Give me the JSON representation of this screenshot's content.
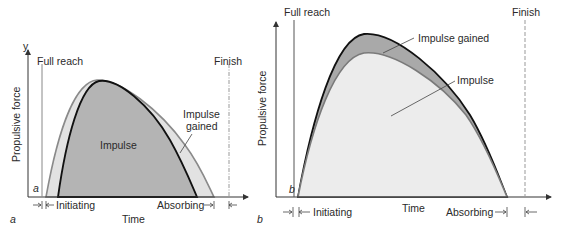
{
  "panels": [
    {
      "id": "a",
      "panel_label": "a",
      "corner_label": "a",
      "y_axis_letter": "y",
      "y_axis_label": "Propulsive force",
      "x_axis_label": "Time",
      "marker_left": "Full reach",
      "marker_right": "Finish",
      "area_inner_label": "Impulse",
      "area_outer_label_line1": "Impulse",
      "area_outer_label_line2": "gained",
      "phase_left": "Initiating",
      "phase_right": "Absorbing",
      "colors": {
        "inner_fill": "#b4b4b4",
        "outer_fill": "#e2e2e2",
        "inner_stroke": "#111111",
        "outer_stroke": "#8a8a8a"
      }
    },
    {
      "id": "b",
      "panel_label": "b",
      "corner_label": "b",
      "y_axis_label": "Propulsive force",
      "x_axis_label": "Time",
      "marker_left": "Full reach",
      "marker_right": "Finish",
      "area_top_label": "Impulse gained",
      "area_main_label": "Impulse",
      "phase_left": "Initiating",
      "phase_right": "Absorbing",
      "colors": {
        "inner_fill": "#ececec",
        "outer_fill": "#a9a9a9",
        "inner_stroke": "#7a7a7a",
        "outer_stroke": "#111111"
      }
    }
  ]
}
